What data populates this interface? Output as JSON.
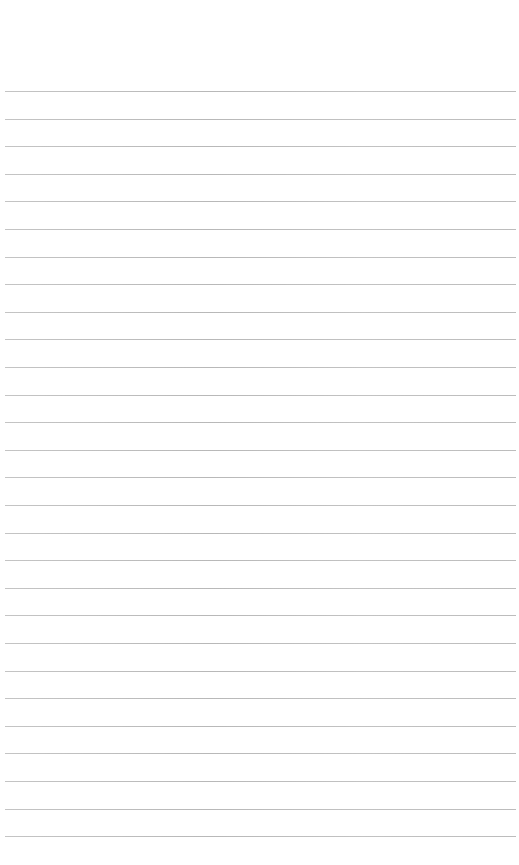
{
  "page": {
    "type": "ruled-paper",
    "background_color": "#ffffff",
    "line_color": "#bdbdbd",
    "line_count": 28,
    "first_line_y": 91,
    "line_spacing": 27.6,
    "line_left": 5,
    "line_right": 516
  }
}
